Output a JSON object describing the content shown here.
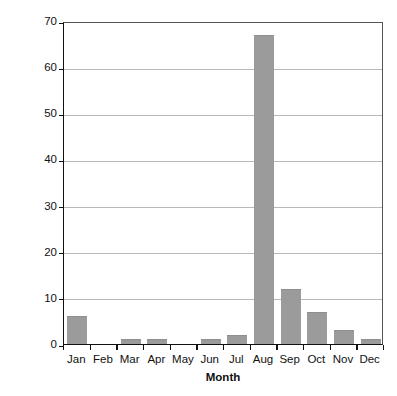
{
  "chart_data": {
    "type": "bar",
    "title": "",
    "categories": [
      "Jan",
      "Feb",
      "Mar",
      "Apr",
      "May",
      "Jun",
      "Jul",
      "Aug",
      "Sep",
      "Oct",
      "Nov",
      "Dec"
    ],
    "values": [
      6,
      0,
      1,
      1,
      0,
      1,
      2,
      67,
      12,
      7,
      3,
      1
    ],
    "xlabel": "Month",
    "ylabel": "No. of illnesses",
    "ylim": [
      0,
      70
    ],
    "ytick_values": [
      0,
      10,
      20,
      30,
      40,
      50,
      60,
      70
    ],
    "ytick_labels": [
      "0",
      "10",
      "20",
      "30",
      "40",
      "50",
      "60",
      "70"
    ],
    "grid": "horizontal",
    "legend": "none",
    "bar_color": "#9b9b9b",
    "axis_color": "#111111",
    "gridline_color": "#b9b9b9"
  },
  "caption_sliver": ""
}
